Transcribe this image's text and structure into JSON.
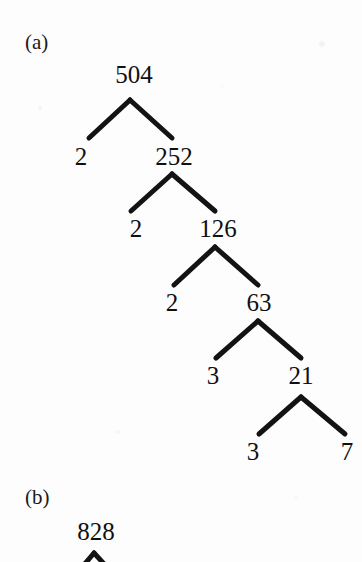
{
  "figure": {
    "type": "factor-tree-diagram",
    "background_color": "#fdfdfd",
    "ink_color": "#131313",
    "panels": [
      {
        "id": "a",
        "label": "(a)",
        "label_x": 25,
        "label_y": 32,
        "number_factorized": "504",
        "factorization": "504 = 2 x 2 x 2 x 3 x 3 x 7",
        "nodes": [
          {
            "id": "a-504",
            "text": "504",
            "cx": 134,
            "top": 62
          },
          {
            "id": "a-2-1",
            "text": "2",
            "cx": 81,
            "top": 144
          },
          {
            "id": "a-252",
            "text": "252",
            "cx": 174,
            "top": 144
          },
          {
            "id": "a-2-2",
            "text": "2",
            "cx": 136,
            "top": 216
          },
          {
            "id": "a-126",
            "text": "126",
            "cx": 218,
            "top": 216
          },
          {
            "id": "a-2-3",
            "text": "2",
            "cx": 172,
            "top": 290
          },
          {
            "id": "a-63",
            "text": "63",
            "cx": 259,
            "top": 290
          },
          {
            "id": "a-3-1",
            "text": "3",
            "cx": 213,
            "top": 363
          },
          {
            "id": "a-21",
            "text": "21",
            "cx": 301,
            "top": 363
          },
          {
            "id": "a-3-2",
            "text": "3",
            "cx": 253,
            "top": 439
          },
          {
            "id": "a-7",
            "text": "7",
            "cx": 347,
            "top": 439
          }
        ],
        "branches": [
          {
            "id": "a-branch-1",
            "apex_x": 130,
            "apex_y": 100,
            "left_x": 89,
            "left_y": 138,
            "right_x": 172,
            "right_y": 138
          },
          {
            "id": "a-branch-2",
            "apex_x": 172,
            "apex_y": 174,
            "left_x": 131,
            "left_y": 211,
            "right_x": 215,
            "right_y": 211
          },
          {
            "id": "a-branch-3",
            "apex_x": 215,
            "apex_y": 247,
            "left_x": 174,
            "left_y": 285,
            "right_x": 258,
            "right_y": 285
          },
          {
            "id": "a-branch-4",
            "apex_x": 258,
            "apex_y": 321,
            "left_x": 216,
            "left_y": 358,
            "right_x": 301,
            "right_y": 358
          },
          {
            "id": "a-branch-5",
            "apex_x": 301,
            "apex_y": 397,
            "left_x": 259,
            "left_y": 434,
            "right_x": 345,
            "right_y": 434
          }
        ]
      },
      {
        "id": "b",
        "label": "(b)",
        "label_x": 25,
        "label_y": 487,
        "number_factorized": "828",
        "nodes": [
          {
            "id": "b-828",
            "text": "828",
            "cx": 96,
            "top": 519
          }
        ],
        "branches": [
          {
            "id": "b-branch-1",
            "apex_x": 94,
            "apex_y": 553,
            "left_x": 83,
            "left_y": 564,
            "right_x": 105,
            "right_y": 564
          }
        ]
      }
    ]
  }
}
